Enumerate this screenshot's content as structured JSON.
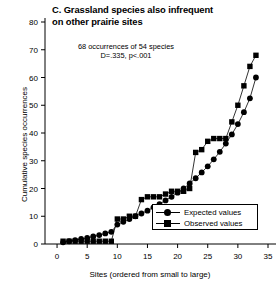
{
  "figure": {
    "panel_letter": "C.",
    "title_lines": [
      "C. Grassland species also infrequent",
      "on other prairie sites"
    ],
    "annotation_lines": [
      "68 occurrences of 54 species",
      "D=.335, p<.001"
    ],
    "background_color": "#ffffff",
    "ink_color": "#000000"
  },
  "legend": {
    "entries": [
      {
        "label": "Expected values",
        "marker": "circle"
      },
      {
        "label": "Observed values",
        "marker": "square"
      }
    ]
  },
  "chart_data": {
    "type": "line",
    "title": "C. Grassland species also infrequent on other prairie sites",
    "subtitle": "68 occurrences of 54 species; D=.335, p<.001",
    "xlabel": "Sites (ordered from small to large)",
    "ylabel": "Cumulative species occurrences",
    "xlim": [
      -2,
      35
    ],
    "ylim": [
      0,
      80
    ],
    "xticks": [
      0,
      5,
      10,
      15,
      20,
      25,
      30,
      35
    ],
    "yticks": [
      0,
      10,
      20,
      30,
      40,
      50,
      60,
      70,
      80
    ],
    "grid": false,
    "legend_position": "lower right",
    "annotations": [
      {
        "text": "68 occurrences of 54 species",
        "x": 10,
        "y": 73
      },
      {
        "text": "D=.335, p<.001",
        "x": 10,
        "y": 69
      }
    ],
    "series": [
      {
        "name": "Expected values",
        "marker": "circle",
        "color": "#000000",
        "x": [
          1,
          2,
          3,
          4,
          5,
          6,
          7,
          8,
          9,
          10,
          11,
          12,
          13,
          14,
          15,
          16,
          17,
          18,
          19,
          20,
          21,
          22,
          23,
          24,
          25,
          26,
          27,
          28,
          29,
          30,
          31,
          32,
          33
        ],
        "y": [
          0.6,
          1.0,
          1.4,
          1.8,
          2.2,
          2.7,
          3.2,
          3.8,
          4.4,
          7.0,
          8.0,
          9.0,
          10.0,
          11.0,
          12.0,
          13.2,
          14.4,
          15.7,
          17.0,
          18.5,
          20.0,
          21.8,
          23.7,
          25.8,
          28.0,
          30.5,
          33.2,
          36.2,
          39.5,
          43.2,
          47.5,
          52.5,
          60.0
        ]
      },
      {
        "name": "Observed values",
        "marker": "square",
        "color": "#000000",
        "x": [
          1,
          2,
          3,
          4,
          5,
          6,
          7,
          8,
          9,
          10,
          11,
          12,
          13,
          14,
          15,
          16,
          17,
          18,
          19,
          20,
          21,
          22,
          23,
          24,
          25,
          26,
          27,
          28,
          29,
          30,
          31,
          32,
          33
        ],
        "y": [
          1.0,
          1.0,
          1.0,
          1.0,
          1.0,
          1.0,
          1.0,
          1.0,
          1.0,
          9.0,
          9.0,
          10.0,
          10.0,
          16.0,
          17.0,
          17.0,
          17.0,
          18.0,
          19.0,
          19.0,
          19.0,
          20.0,
          33.0,
          34.0,
          37.0,
          38.0,
          38.0,
          38.0,
          44.0,
          50.0,
          57.0,
          64.0,
          68.0
        ]
      }
    ]
  }
}
